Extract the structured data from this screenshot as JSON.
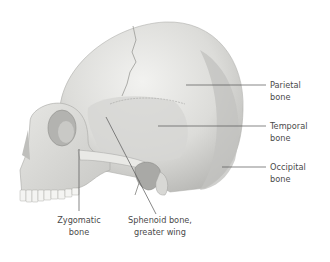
{
  "figure": {
    "labels": {
      "parietal": {
        "line1": "Parietal",
        "line2": "bone"
      },
      "temporal": {
        "line1": "Temporal",
        "line2": "bone"
      },
      "occipital": {
        "line1": "Occipital",
        "line2": "bone"
      },
      "zygomatic": {
        "line1": "Zygomatic",
        "line2": "bone"
      },
      "sphenoid": {
        "line1": "Sphenoid bone,",
        "line2": "greater wing"
      }
    }
  }
}
